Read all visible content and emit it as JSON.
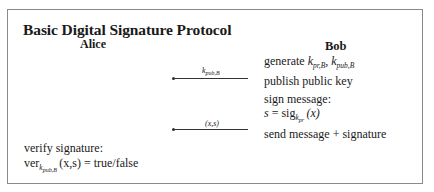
{
  "diagram": {
    "title": "Basic Digital Signature Protocol",
    "parties": {
      "left": "Alice",
      "right": "Bob"
    },
    "bob_steps": [
      {
        "text": "generate ",
        "math": "k_{pr,B}, k_{pub,B}"
      },
      {
        "text": "publish public key"
      },
      {
        "text": "sign message:"
      },
      {
        "math": "s = sig_{k_pr}(x)"
      },
      {
        "text": "send message + signature"
      }
    ],
    "alice_steps": [
      {
        "text": "verify signature:"
      },
      {
        "math": "ver_{k_pub,B}(x,s) = true/false"
      }
    ],
    "messages": [
      {
        "label": "k_pub,B",
        "direction": "Bob→Alice"
      },
      {
        "label": "(x,s)",
        "direction": "Bob→Alice"
      }
    ],
    "labels": {
      "generate": "generate",
      "k_pr": "k",
      "k_pr_sub": "pr,B",
      "k_pub": "k",
      "k_pub_sub": "pub,B",
      "publish": "publish public key",
      "sign": "sign message:",
      "s_eq": "s = sig",
      "sig_sub": "k",
      "sig_subsub": "pr",
      "sig_arg": "(x)",
      "send": "send message + signature",
      "verify": "verify signature:",
      "ver": "ver",
      "ver_sub": "k",
      "ver_subsub": "pub,B",
      "ver_rest": "(x,s) = true/false",
      "arrow1_k": "k",
      "arrow1_sub": "pub,B",
      "arrow2": "(x,s)"
    }
  }
}
